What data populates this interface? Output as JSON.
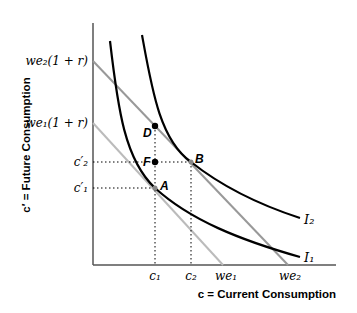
{
  "diagram": {
    "xlabel": "c = Current Consumption",
    "ylabel": "c′ = Future Consumption",
    "y_ticks": {
      "we2_1r": "we₂(1 + r)",
      "we1_1r": "we₁(1 + r)",
      "c2p": "c′₂",
      "c1p": "c′₁"
    },
    "x_ticks": {
      "c1": "c₁",
      "c2": "c₂",
      "we1": "we₁",
      "we2": "we₂"
    },
    "points": {
      "A": "A",
      "B": "B",
      "D": "D",
      "F": "F"
    },
    "curves": {
      "I1": "I₁",
      "I2": "I₂"
    },
    "colors": {
      "indifference": "#000000",
      "budget1": "#b8b8b8",
      "budget2": "#999999",
      "axis": "#555555"
    }
  }
}
